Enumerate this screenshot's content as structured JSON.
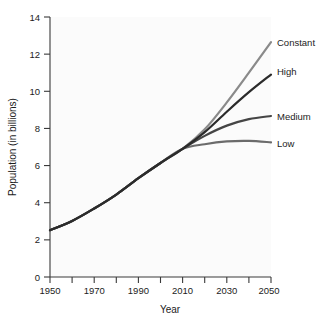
{
  "chart_data": {
    "type": "line",
    "title": "",
    "xlabel": "Year",
    "ylabel": "Population (in billions)",
    "xlim": [
      1950,
      2050
    ],
    "ylim": [
      0,
      14
    ],
    "grid": false,
    "legend_position": "right-of-plot-inline-labels",
    "x_ticks_major": [
      1950,
      1970,
      1990,
      2010,
      2030,
      2050
    ],
    "x_ticks_minor": [
      1960,
      1980,
      2000,
      2020,
      2040
    ],
    "x_tick_labels": [
      "1950",
      "1970",
      "1990",
      "2010",
      "2030",
      "2050"
    ],
    "y_ticks": [
      0,
      2,
      4,
      6,
      8,
      10,
      12,
      14
    ],
    "y_tick_labels": [
      "0",
      "2",
      "4",
      "6",
      "8",
      "10",
      "12",
      "14"
    ],
    "x": [
      1950,
      1960,
      1970,
      1980,
      1990,
      2000,
      2010,
      2020,
      2030,
      2040,
      2050
    ],
    "series": [
      {
        "name": "Constant",
        "label": "Constant",
        "color": "#8a8a8a",
        "values": [
          2.52,
          3.02,
          3.69,
          4.44,
          5.32,
          6.14,
          6.9,
          7.95,
          9.4,
          11.0,
          12.65
        ]
      },
      {
        "name": "High",
        "label": "High",
        "color": "#2b2b2b",
        "values": [
          2.52,
          3.02,
          3.69,
          4.44,
          5.32,
          6.14,
          6.9,
          7.8,
          8.9,
          9.95,
          10.9
        ]
      },
      {
        "name": "Medium",
        "label": "Medium",
        "color": "#454545",
        "values": [
          2.52,
          3.02,
          3.69,
          4.44,
          5.32,
          6.14,
          6.9,
          7.6,
          8.15,
          8.5,
          8.67
        ]
      },
      {
        "name": "Low",
        "label": "Low",
        "color": "#6b6b6b",
        "values": [
          2.52,
          3.02,
          3.69,
          4.44,
          5.32,
          6.14,
          6.9,
          7.15,
          7.3,
          7.33,
          7.25
        ]
      }
    ]
  },
  "axes": {
    "y_title": "Population (in billions)",
    "x_title": "Year"
  },
  "ticks": {
    "y": [
      "14",
      "12",
      "10",
      "8",
      "6",
      "4",
      "2",
      "0"
    ],
    "x": [
      "1950",
      "1970",
      "1990",
      "2010",
      "2030",
      "2050"
    ]
  },
  "labels": {
    "constant": "Constant",
    "high": "High",
    "medium": "Medium",
    "low": "Low"
  }
}
